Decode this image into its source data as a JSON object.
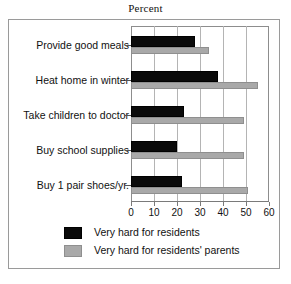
{
  "chart_data": {
    "type": "bar",
    "orientation": "horizontal",
    "title": "Percent",
    "xlabel": "",
    "ylabel": "",
    "xlim": [
      0,
      60
    ],
    "xticks": [
      0,
      10,
      20,
      30,
      40,
      50,
      60
    ],
    "xtick_labels": [
      "0",
      "10",
      "20",
      "30",
      "40",
      "50",
      "60"
    ],
    "grid": true,
    "grid_axis": "x",
    "legend_position": "bottom",
    "categories": [
      "Provide good meals",
      "Heat home in winter",
      "Take children to doctor",
      "Buy school supplies",
      "Buy 1 pair shoes/yr."
    ],
    "series": [
      {
        "name": "Very hard for residents",
        "color": "#0a0a0a",
        "values": [
          28,
          38,
          23,
          20,
          22
        ]
      },
      {
        "name": "Very hard for residents' parents",
        "color": "#a9a9a9",
        "values": [
          34,
          55,
          49,
          49,
          51
        ]
      }
    ]
  }
}
